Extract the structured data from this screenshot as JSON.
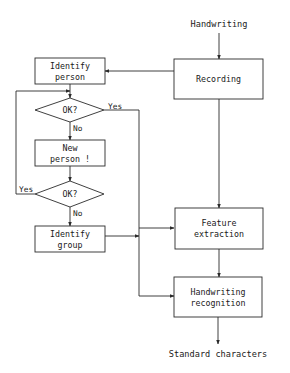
{
  "diagram": {
    "input_label": "Handwriting",
    "output_label": "Standard characters",
    "nodes": {
      "recording": {
        "line1": "Recording"
      },
      "identify_person": {
        "line1": "Identify",
        "line2": "person"
      },
      "ok1": {
        "line1": "OK?"
      },
      "new_person": {
        "line1": "New",
        "line2": "person !"
      },
      "ok2": {
        "line1": "OK?"
      },
      "identify_group": {
        "line1": "Identify",
        "line2": "group"
      },
      "feature_extraction": {
        "line1": "Feature",
        "line2": "extraction"
      },
      "handwriting_recognition": {
        "line1": "Handwriting",
        "line2": "recognition"
      }
    },
    "edge_labels": {
      "ok1_yes": "Yes",
      "ok1_no": "No",
      "ok2_yes": "Yes",
      "ok2_no": "No"
    }
  }
}
